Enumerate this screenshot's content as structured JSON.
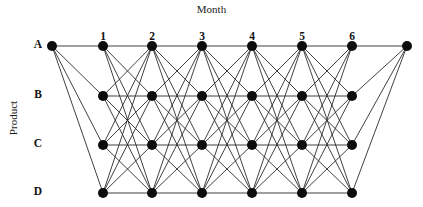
{
  "axes": {
    "x_title": "Month",
    "y_title": "Product"
  },
  "chart_data": {
    "type": "diagram",
    "title": "Month",
    "xlabel": "Month",
    "ylabel": "Product",
    "grid": false,
    "legend": "none",
    "categories": [
      "1",
      "2",
      "3",
      "4",
      "5",
      "6"
    ],
    "rows": [
      "A",
      "B",
      "C",
      "D"
    ],
    "column_labels": [
      "1",
      "2",
      "3",
      "4",
      "5",
      "6"
    ],
    "row_labels": [
      "A",
      "B",
      "C",
      "D"
    ],
    "column_x": [
      103,
      152,
      202,
      252,
      302,
      352
    ],
    "row_y": [
      46,
      96,
      145,
      193
    ],
    "column_label_y": 30,
    "row_label_x": 38,
    "source": {
      "label": "",
      "x": 52,
      "y": 46
    },
    "sink": {
      "label": "",
      "x": 407,
      "y": 46
    },
    "node_radius": 5,
    "node_color": "#0d0d0d",
    "edge_color": "#2b2b2b",
    "edge_width": 0.9,
    "background": "#ffffff",
    "node_count": 26,
    "stage_count": 6,
    "nodes_per_stage": 4,
    "edges_between_stages": 16,
    "source_edges": 4,
    "sink_edges": 4,
    "total_edges": 88
  }
}
